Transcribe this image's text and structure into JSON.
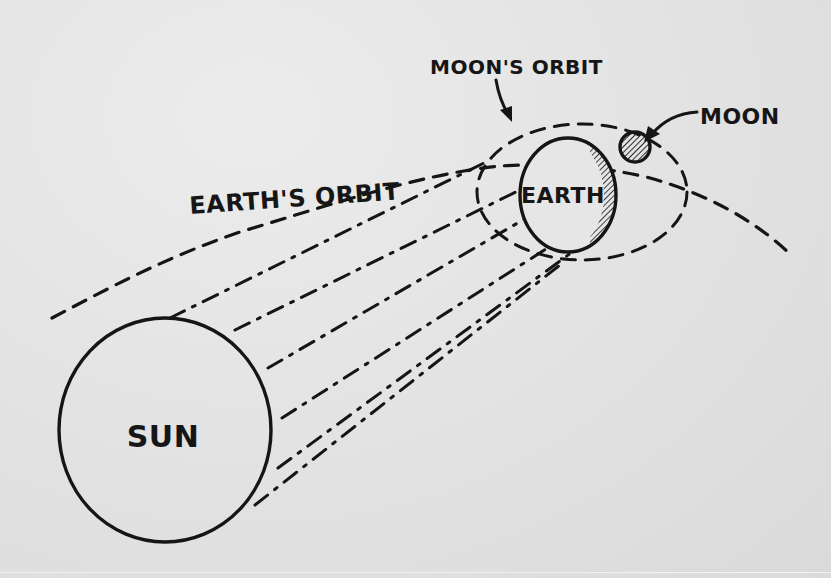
{
  "diagram": {
    "colors": {
      "ink": "#151515",
      "paper": "#e4e4e4"
    },
    "bodies": {
      "sun": {
        "label": "SUN",
        "cx": 165,
        "cy": 430,
        "rx": 106,
        "ry": 112
      },
      "earth": {
        "label": "EARTH",
        "cx": 568,
        "cy": 195,
        "rx": 48,
        "ry": 57
      },
      "moon": {
        "label": "MOON",
        "cx": 635,
        "cy": 147,
        "r": 15
      }
    },
    "orbits": {
      "earth_orbit": {
        "label": "EARTH'S ORBIT"
      },
      "moon_orbit": {
        "label": "MOON'S ORBIT"
      }
    },
    "annotations": [
      {
        "label": "MOON'S ORBIT",
        "points_to": "moon_orbit"
      },
      {
        "label": "MOON",
        "points_to": "moon"
      }
    ]
  }
}
